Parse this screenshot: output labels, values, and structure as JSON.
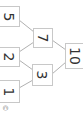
{
  "diagram": {
    "type": "number-pyramid",
    "orientation": "rotated-90",
    "nodes": [
      {
        "id": "n5",
        "label": "5",
        "x": 0,
        "y": 6,
        "w": 20,
        "h": 21
      },
      {
        "id": "n2",
        "label": "2",
        "x": 0,
        "y": 47,
        "w": 20,
        "h": 20
      },
      {
        "id": "n1",
        "label": "1",
        "x": 0,
        "y": 80,
        "w": 20,
        "h": 23
      },
      {
        "id": "n7",
        "label": "7",
        "x": 33,
        "y": 28,
        "w": 20,
        "h": 20
      },
      {
        "id": "n3",
        "label": "3",
        "x": 32,
        "y": 64,
        "w": 21,
        "h": 22
      },
      {
        "id": "n10",
        "label": "10",
        "x": 65,
        "y": 43,
        "w": 19,
        "h": 26
      }
    ],
    "edges": [
      {
        "from": "n5",
        "to": "n7"
      },
      {
        "from": "n2",
        "to": "n7"
      },
      {
        "from": "n2",
        "to": "n3"
      },
      {
        "from": "n1",
        "to": "n3"
      },
      {
        "from": "n7",
        "to": "n10"
      },
      {
        "from": "n3",
        "to": "n10"
      }
    ],
    "mark": "©",
    "colors": {
      "border": "#c8c8c8",
      "edge": "#b0b0b0",
      "text": "#333333"
    }
  }
}
